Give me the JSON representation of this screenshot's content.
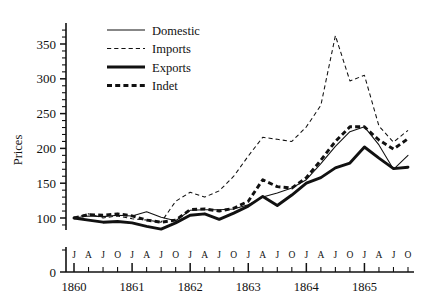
{
  "chart_data": {
    "type": "line",
    "title": "",
    "xlabel": "",
    "ylabel": "Prices",
    "ylim": [
      0,
      375
    ],
    "yticks": [
      0,
      100,
      150,
      200,
      250,
      300,
      350
    ],
    "ytick_labels": [
      "0",
      "100",
      "150",
      "200",
      "250",
      "300",
      "350"
    ],
    "y_axis_break": true,
    "y_axis_break_note": "axis broken between 0 and 100",
    "grid": false,
    "legend_position": "upper left",
    "x_month_labels": [
      "J",
      "A",
      "J",
      "O",
      "J",
      "A",
      "J",
      "O",
      "J",
      "A",
      "J",
      "O",
      "J",
      "A",
      "J",
      "O",
      "J",
      "A",
      "J",
      "O",
      "J",
      "A",
      "J",
      "O"
    ],
    "x_year_labels": [
      "1860",
      "1861",
      "1862",
      "1863",
      "1864",
      "1865"
    ],
    "x": [
      "1860-01",
      "1860-04",
      "1860-07",
      "1860-10",
      "1861-01",
      "1861-04",
      "1861-07",
      "1861-10",
      "1862-01",
      "1862-04",
      "1862-07",
      "1862-10",
      "1863-01",
      "1863-04",
      "1863-07",
      "1863-10",
      "1864-01",
      "1864-04",
      "1864-07",
      "1864-10",
      "1865-01",
      "1865-04",
      "1865-07",
      "1865-10"
    ],
    "series": [
      {
        "name": "Domestic",
        "style": "thin-solid",
        "values": [
          100,
          103,
          102,
          104,
          103,
          109,
          101,
          96,
          111,
          112,
          112,
          113,
          119,
          130,
          136,
          143,
          155,
          178,
          203,
          224,
          231,
          205,
          170,
          190
        ]
      },
      {
        "name": "Imports",
        "style": "thin-dashed",
        "values": [
          100,
          106,
          100,
          103,
          99,
          97,
          94,
          124,
          137,
          130,
          139,
          160,
          189,
          216,
          213,
          210,
          231,
          262,
          362,
          297,
          305,
          232,
          209,
          226
        ]
      },
      {
        "name": "Exports",
        "style": "thick-solid",
        "values": [
          100,
          97,
          94,
          95,
          93,
          88,
          84,
          93,
          104,
          106,
          98,
          107,
          117,
          131,
          118,
          133,
          150,
          158,
          172,
          179,
          202,
          186,
          171,
          173
        ]
      },
      {
        "name": "Indet",
        "style": "thick-dashed",
        "values": [
          100,
          105,
          104,
          106,
          103,
          97,
          94,
          97,
          112,
          113,
          110,
          114,
          124,
          155,
          145,
          143,
          158,
          183,
          210,
          231,
          231,
          212,
          199,
          214
        ]
      }
    ],
    "legend": [
      {
        "label": "Domestic",
        "style": "thin-solid"
      },
      {
        "label": "Imports",
        "style": "thin-dashed"
      },
      {
        "label": "Exports",
        "style": "thick-solid"
      },
      {
        "label": "Indet",
        "style": "thick-dashed"
      }
    ]
  }
}
